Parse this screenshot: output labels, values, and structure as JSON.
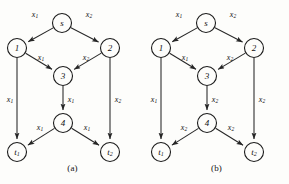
{
  "figure": {
    "type": "flow-network-pair",
    "panels": [
      {
        "caption": "(a)",
        "nodes": [
          {
            "id": "s",
            "label": "s",
            "sub": "",
            "cx": 62,
            "cy": 23
          },
          {
            "id": "1",
            "label": "1",
            "sub": "",
            "cx": 17,
            "cy": 48
          },
          {
            "id": "2",
            "label": "2",
            "sub": "",
            "cx": 110,
            "cy": 48
          },
          {
            "id": "3",
            "label": "3",
            "sub": "",
            "cx": 63,
            "cy": 76
          },
          {
            "id": "4",
            "label": "4",
            "sub": "",
            "cx": 63,
            "cy": 123
          },
          {
            "id": "t1",
            "label": "t",
            "sub": "1",
            "cx": 17,
            "cy": 152
          },
          {
            "id": "t2",
            "label": "t",
            "sub": "2",
            "cx": 110,
            "cy": 152
          }
        ],
        "edges": [
          {
            "from": "s",
            "to": "1",
            "label": "x",
            "sub": "1",
            "lx": 35,
            "ly": 15
          },
          {
            "from": "s",
            "to": "2",
            "label": "x",
            "sub": "2",
            "lx": 89,
            "ly": 15
          },
          {
            "from": "1",
            "to": "3",
            "label": "x",
            "sub": "1",
            "lx": 41,
            "ly": 58
          },
          {
            "from": "2",
            "to": "3",
            "label": "x",
            "sub": "2",
            "lx": 86,
            "ly": 58
          },
          {
            "from": "1",
            "to": "t1",
            "label": "x",
            "sub": "1",
            "lx": 10,
            "ly": 100
          },
          {
            "from": "3",
            "to": "4",
            "label": "x",
            "sub": "1",
            "lx": 71,
            "ly": 100
          },
          {
            "from": "2",
            "to": "t2",
            "label": "x",
            "sub": "2",
            "lx": 118,
            "ly": 100
          },
          {
            "from": "4",
            "to": "t1",
            "label": "x",
            "sub": "1",
            "lx": 40,
            "ly": 128
          },
          {
            "from": "4",
            "to": "t2",
            "label": "x",
            "sub": "1",
            "lx": 87,
            "ly": 128
          }
        ]
      },
      {
        "caption": "(b)",
        "nodes": [
          {
            "id": "s",
            "label": "s",
            "sub": "",
            "cx": 62,
            "cy": 23
          },
          {
            "id": "1",
            "label": "1",
            "sub": "",
            "cx": 17,
            "cy": 48
          },
          {
            "id": "2",
            "label": "2",
            "sub": "",
            "cx": 110,
            "cy": 48
          },
          {
            "id": "3",
            "label": "3",
            "sub": "",
            "cx": 63,
            "cy": 76
          },
          {
            "id": "4",
            "label": "4",
            "sub": "",
            "cx": 63,
            "cy": 123
          },
          {
            "id": "t1",
            "label": "t",
            "sub": "1",
            "cx": 17,
            "cy": 152
          },
          {
            "id": "t2",
            "label": "t",
            "sub": "2",
            "cx": 110,
            "cy": 152
          }
        ],
        "edges": [
          {
            "from": "s",
            "to": "1",
            "label": "x",
            "sub": "1",
            "lx": 35,
            "ly": 15
          },
          {
            "from": "s",
            "to": "2",
            "label": "x",
            "sub": "2",
            "lx": 89,
            "ly": 15
          },
          {
            "from": "1",
            "to": "3",
            "label": "x",
            "sub": "1",
            "lx": 41,
            "ly": 58
          },
          {
            "from": "2",
            "to": "3",
            "label": "x",
            "sub": "2",
            "lx": 86,
            "ly": 58
          },
          {
            "from": "1",
            "to": "t1",
            "label": "x",
            "sub": "1",
            "lx": 10,
            "ly": 100
          },
          {
            "from": "3",
            "to": "4",
            "label": "x",
            "sub": "2",
            "lx": 71,
            "ly": 100
          },
          {
            "from": "2",
            "to": "t2",
            "label": "x",
            "sub": "2",
            "lx": 118,
            "ly": 100
          },
          {
            "from": "4",
            "to": "t1",
            "label": "x",
            "sub": "2",
            "lx": 40,
            "ly": 128
          },
          {
            "from": "4",
            "to": "t2",
            "label": "x",
            "sub": "2",
            "lx": 87,
            "ly": 128
          }
        ]
      }
    ],
    "colors": {
      "stroke": "#262626",
      "node_stroke": "#1b1b1b",
      "text": "#121212",
      "background": "#fdfdfb"
    },
    "node_radius": 9.5
  }
}
